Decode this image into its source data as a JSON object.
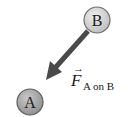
{
  "diagram": {
    "objects": [
      {
        "id": "B",
        "label": "B",
        "fill": "#d4d4d4"
      },
      {
        "id": "A",
        "label": "A",
        "fill": "#a9a9a9"
      }
    ],
    "force": {
      "symbol": "F",
      "subscript": "A on B",
      "vector_arrow": "→",
      "arrow_color": "#4a4a4a"
    }
  }
}
